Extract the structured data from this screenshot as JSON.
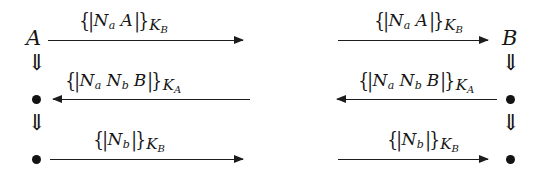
{
  "figure": {
    "name": "protocol-message-sequence-diagram",
    "notation": {
      "encrypt_open": "{|",
      "encrypt_close": "|}",
      "double_down_arrow": "⇓",
      "node_dot": "●",
      "arrow_right": "→",
      "arrow_left": "←"
    },
    "ink_color": "#151515",
    "background_color": "#ffffff",
    "panels": [
      {
        "id": "panel-left",
        "principal": {
          "label": "A",
          "position": "left"
        },
        "lifeline": {
          "side": "left",
          "glyphs": [
            "⇓",
            "●",
            "⇓",
            "●"
          ]
        },
        "messages": [
          {
            "index": 1,
            "direction": "right",
            "open": "{|",
            "body": [
              {
                "base": "N",
                "sub": "a"
              },
              {
                "base": "A",
                "sub": ""
              }
            ],
            "close": "|}",
            "key": {
              "base": "K",
              "sub": "B"
            },
            "plain": "{|Na A|}KB"
          },
          {
            "index": 2,
            "direction": "left",
            "open": "{|",
            "body": [
              {
                "base": "N",
                "sub": "a"
              },
              {
                "base": "N",
                "sub": "b"
              },
              {
                "base": "B",
                "sub": ""
              }
            ],
            "close": "|}",
            "key": {
              "base": "K",
              "sub": "A"
            },
            "plain": "{|Na Nb B|}KA"
          },
          {
            "index": 3,
            "direction": "right",
            "open": "{|",
            "body": [
              {
                "base": "N",
                "sub": "b"
              }
            ],
            "close": "|}",
            "key": {
              "base": "K",
              "sub": "B"
            },
            "plain": "{|Nb|}KB"
          }
        ]
      },
      {
        "id": "panel-right",
        "principal": {
          "label": "B",
          "position": "right"
        },
        "lifeline": {
          "side": "right",
          "glyphs": [
            "⇓",
            "●",
            "⇓",
            "●"
          ]
        },
        "messages": [
          {
            "index": 1,
            "direction": "right",
            "open": "{|",
            "body": [
              {
                "base": "N",
                "sub": "a"
              },
              {
                "base": "A",
                "sub": ""
              }
            ],
            "close": "|}",
            "key": {
              "base": "K",
              "sub": "B"
            },
            "plain": "{|Na A|}KB"
          },
          {
            "index": 2,
            "direction": "left",
            "open": "{|",
            "body": [
              {
                "base": "N",
                "sub": "a"
              },
              {
                "base": "N",
                "sub": "b"
              },
              {
                "base": "B",
                "sub": ""
              }
            ],
            "close": "|}",
            "key": {
              "base": "K",
              "sub": "A"
            },
            "plain": "{|Na Nb B|}KA"
          },
          {
            "index": 3,
            "direction": "right",
            "open": "{|",
            "body": [
              {
                "base": "N",
                "sub": "b"
              }
            ],
            "close": "|}",
            "key": {
              "base": "K",
              "sub": "B"
            },
            "plain": "{|Nb|}KB"
          }
        ]
      }
    ]
  }
}
